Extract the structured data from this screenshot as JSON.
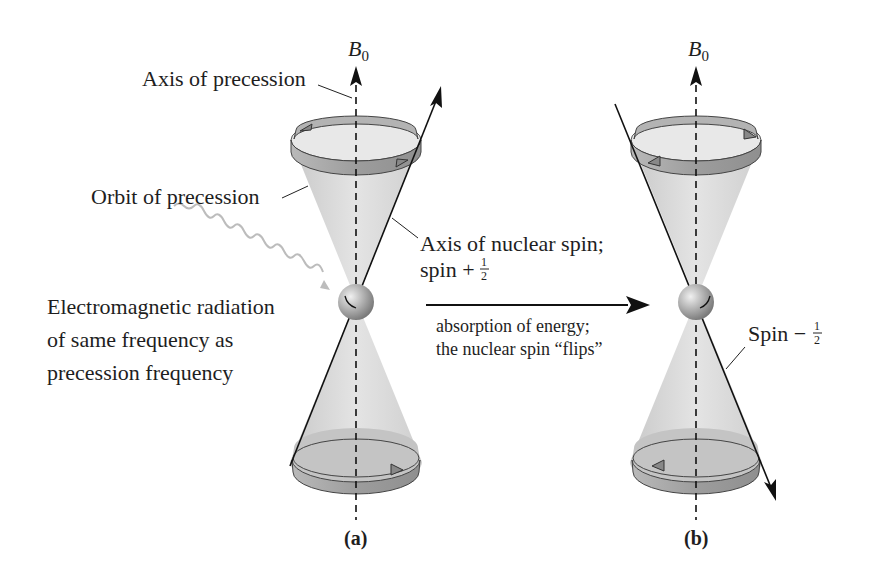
{
  "figure": {
    "panel_a": {
      "caption": "(a)",
      "field_label": "B",
      "field_sub": "0",
      "axis_of_precession": "Axis of precession",
      "orbit_of_precession": "Orbit of precession",
      "axis_of_nuclear_spin": "Axis of nuclear spin;",
      "spin_state_prefix": "spin +",
      "spin_fraction_num": "1",
      "spin_fraction_den": "2",
      "radiation_lines": [
        "Electromagnetic radiation",
        "of same frequency as",
        "precession frequency"
      ]
    },
    "transition": {
      "lines": [
        "absorption of energy;",
        "the nuclear spin “flips”"
      ]
    },
    "panel_b": {
      "caption": "(b)",
      "field_label": "B",
      "field_sub": "0",
      "spin_state_prefix": "Spin −",
      "spin_fraction_num": "1",
      "spin_fraction_den": "2"
    },
    "colors": {
      "cone_fill": "#d6d6d6",
      "band_fill": "#a8a8a8",
      "line": "#1a1a1a",
      "wave": "#bdbdbd",
      "sphere": "#9a9a9a"
    }
  }
}
